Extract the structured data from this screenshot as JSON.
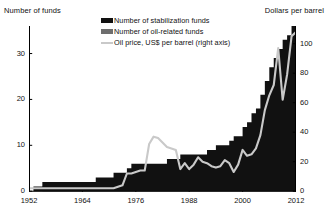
{
  "axes": {
    "left_title": "Number of funds",
    "right_title": "Dollars per barrel",
    "left_ticks": [
      "0",
      "10",
      "20",
      "30"
    ],
    "right_ticks": [
      "0",
      "20",
      "40",
      "60",
      "80",
      "100"
    ],
    "x_ticks": [
      "1952",
      "1964",
      "1976",
      "1988",
      "2000",
      "2012"
    ]
  },
  "legend": {
    "items": [
      {
        "label": "Number of stabilization funds",
        "color": "#111111",
        "marker": "swatch"
      },
      {
        "label": "Number of oil-related funds",
        "color": "#6e6e6e",
        "marker": "swatch"
      },
      {
        "label": "Oil price, US$ per barrel (right axis)",
        "color": "#c9c9c9",
        "marker": "line"
      }
    ]
  },
  "colors": {
    "stabilization": "#111111",
    "oil_related": "#6e6e6e",
    "oil_price_line": "#c9c9c9",
    "axis": "#000000",
    "background": "#ffffff"
  },
  "chart_data": {
    "type": "area",
    "title": "",
    "subtitle": "",
    "xlabel": "",
    "ylabel": "Number of funds",
    "y2label": "Dollars per barrel",
    "stacked": true,
    "grid": false,
    "legend_position": "top-center",
    "xlim": [
      1952,
      2012
    ],
    "ylim": [
      0,
      36
    ],
    "y2lim": [
      0,
      112
    ],
    "x": [
      1952,
      1953,
      1954,
      1955,
      1956,
      1957,
      1958,
      1959,
      1960,
      1961,
      1962,
      1963,
      1964,
      1965,
      1966,
      1967,
      1968,
      1969,
      1970,
      1971,
      1972,
      1973,
      1974,
      1975,
      1976,
      1977,
      1978,
      1979,
      1980,
      1981,
      1982,
      1983,
      1984,
      1985,
      1986,
      1987,
      1988,
      1989,
      1990,
      1991,
      1992,
      1993,
      1994,
      1995,
      1996,
      1997,
      1998,
      1999,
      2000,
      2001,
      2002,
      2003,
      2004,
      2005,
      2006,
      2007,
      2008,
      2009,
      2010,
      2011,
      2012
    ],
    "series": [
      {
        "name": "Number of oil-related funds",
        "axis": "left",
        "color": "#6e6e6e",
        "values": [
          0,
          0,
          0,
          1,
          1,
          1,
          1,
          1,
          1,
          1,
          1,
          1,
          1,
          1,
          1,
          1,
          1,
          1,
          1,
          2,
          2,
          2,
          2,
          3,
          3,
          3,
          3,
          3,
          3,
          3,
          3,
          3,
          3,
          3,
          4,
          4,
          4,
          4,
          4,
          4,
          4,
          4,
          5,
          5,
          5,
          5,
          6,
          6,
          7,
          8,
          9,
          10,
          12,
          14,
          16,
          17,
          18,
          19,
          20,
          21,
          21
        ]
      },
      {
        "name": "Number of stabilization funds",
        "axis": "left",
        "color": "#111111",
        "values": [
          0,
          1,
          1,
          1,
          1,
          1,
          1,
          1,
          1,
          1,
          1,
          1,
          1,
          1,
          1,
          2,
          2,
          2,
          2,
          2,
          2,
          2,
          3,
          3,
          3,
          3,
          3,
          3,
          3,
          3,
          3,
          4,
          4,
          4,
          4,
          4,
          4,
          4,
          4,
          4,
          5,
          5,
          5,
          5,
          5,
          6,
          6,
          6,
          7,
          7,
          8,
          8,
          9,
          10,
          11,
          12,
          13,
          14,
          14,
          15,
          15
        ]
      },
      {
        "name": "Oil price, US$ per barrel (right axis)",
        "axis": "right",
        "color": "#c9c9c9",
        "type": "line",
        "values": [
          2,
          2,
          2,
          2,
          2,
          2,
          2,
          2,
          2,
          2,
          2,
          2,
          2,
          2,
          2,
          2,
          2,
          2,
          2,
          2,
          3,
          4,
          12,
          12,
          13,
          14,
          14,
          32,
          37,
          36,
          33,
          30,
          29,
          28,
          15,
          19,
          15,
          18,
          23,
          20,
          19,
          17,
          16,
          17,
          21,
          19,
          13,
          18,
          28,
          24,
          25,
          29,
          38,
          55,
          65,
          72,
          97,
          62,
          79,
          105,
          108
        ]
      }
    ]
  }
}
